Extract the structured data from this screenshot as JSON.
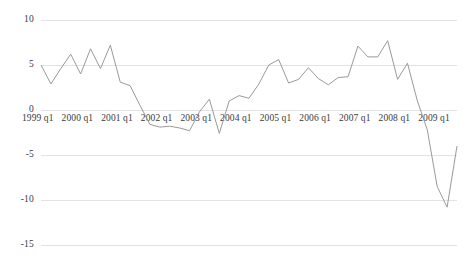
{
  "chart_data": {
    "type": "line",
    "title": "",
    "subtitle": "",
    "xlabel": "",
    "ylabel": "",
    "grid": true,
    "legend": "none",
    "ylim": [
      -15,
      10
    ],
    "ytick_values": [
      10,
      5,
      0,
      -5,
      -10,
      -15
    ],
    "ytick_labels": [
      "10",
      "5",
      "0",
      "-5",
      "-10",
      "-15"
    ],
    "xtick_labels": [
      "1999 q1",
      "2000 q1",
      "2001 q1",
      "2002 q1",
      "2003 q1",
      "2004 q1",
      "2005 q1",
      "2006 q1",
      "2007 q1",
      "2008 q1",
      "2009 q1"
    ],
    "xtick_quarter_index": [
      0,
      4,
      8,
      12,
      16,
      20,
      24,
      28,
      32,
      36,
      40
    ],
    "x": [
      "1999 q1",
      "1999 q2",
      "1999 q3",
      "1999 q4",
      "2000 q1",
      "2000 q2",
      "2000 q3",
      "2000 q4",
      "2001 q1",
      "2001 q2",
      "2001 q3",
      "2001 q4",
      "2002 q1",
      "2002 q2",
      "2002 q3",
      "2002 q4",
      "2003 q1",
      "2003 q2",
      "2003 q3",
      "2003 q4",
      "2004 q1",
      "2004 q2",
      "2004 q3",
      "2004 q4",
      "2005 q1",
      "2005 q2",
      "2005 q3",
      "2005 q4",
      "2006 q1",
      "2006 q2",
      "2006 q3",
      "2006 q4",
      "2007 q1",
      "2007 q2",
      "2007 q3",
      "2007 q4",
      "2008 q1",
      "2008 q2",
      "2008 q3",
      "2008 q4",
      "2009 q1",
      "2009 q2",
      "2009 q3"
    ],
    "series": [
      {
        "name": "growth rate",
        "color": "#9a9a9a",
        "values": [
          5.0,
          2.9,
          4.6,
          6.2,
          4.0,
          6.8,
          4.6,
          7.2,
          3.1,
          2.7,
          0.5,
          -1.6,
          -1.9,
          -1.8,
          -2.0,
          -2.3,
          -0.2,
          1.2,
          -2.6,
          1.0,
          1.6,
          1.3,
          2.9,
          5.0,
          5.6,
          3.0,
          3.4,
          4.7,
          3.5,
          2.8,
          3.6,
          3.7,
          7.1,
          5.9,
          5.9,
          7.7,
          3.4,
          5.2,
          1.0,
          -2.2,
          -8.5,
          -10.8,
          -4.0
        ]
      }
    ],
    "value_range_observed": {
      "min": -10.8,
      "max": 7.7
    }
  },
  "axis_geometry": {
    "plot_left_px": 41,
    "plot_right_px": 457,
    "y_for_10_px": 20,
    "y_for_minus15_px": 245,
    "px_per_unit": 9.0
  },
  "style": {
    "background": "#ffffff",
    "gridline_color": "#e3e3e3",
    "text_color": "#3a3a3a",
    "line_color": "#9a9a9a"
  }
}
